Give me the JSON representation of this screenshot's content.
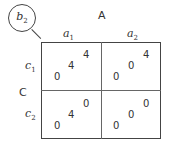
{
  "badge": {
    "label": "b",
    "sub": "2"
  },
  "factor_col": {
    "label": "A",
    "levels": [
      {
        "label": "a",
        "sub": "1"
      },
      {
        "label": "a",
        "sub": "2"
      }
    ]
  },
  "factor_row": {
    "label": "C",
    "levels": [
      {
        "label": "c",
        "sub": "1"
      },
      {
        "label": "c",
        "sub": "2"
      }
    ]
  },
  "cells": [
    {
      "row": "c1",
      "col": "a1",
      "values": [
        "4",
        "4",
        "0"
      ]
    },
    {
      "row": "c1",
      "col": "a2",
      "values": [
        "4",
        "0",
        "0"
      ]
    },
    {
      "row": "c2",
      "col": "a1",
      "values": [
        "0",
        "4",
        "0"
      ]
    },
    {
      "row": "c2",
      "col": "a2",
      "values": [
        "0",
        "0",
        "0"
      ]
    }
  ]
}
